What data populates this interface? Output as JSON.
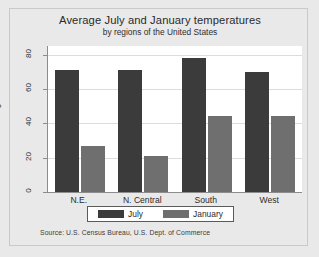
{
  "chart_data": {
    "type": "bar",
    "title": "Average July and January temperatures",
    "subtitle": "by regions of the United States",
    "xlabel": "",
    "ylabel": "Degrees Fahrenheit",
    "ylim": [
      0,
      85
    ],
    "yticks": [
      0,
      20,
      40,
      60,
      80
    ],
    "ytick_labels": [
      "0",
      "20",
      "40",
      "60",
      "80"
    ],
    "grid": true,
    "legend_position": "bottom",
    "categories": [
      "N.E.",
      "N. Central",
      "South",
      "West"
    ],
    "series": [
      {
        "name": "July",
        "color": "#3b3b3b",
        "values": [
          71,
          71,
          78,
          70
        ]
      },
      {
        "name": "January",
        "color": "#6f6f6f",
        "values": [
          27,
          21,
          44,
          44
        ]
      }
    ],
    "source": "Source:  U.S. Census Bureau, U.S. Dept. of Commerce"
  },
  "colors": {
    "background": "#e9e9e9",
    "plot_background": "#ffffff",
    "axis": "#8c8c8c",
    "gridline": "#dcdcdc",
    "july": "#3b3b3b",
    "january": "#6f6f6f",
    "text": "#2c2c2c"
  }
}
